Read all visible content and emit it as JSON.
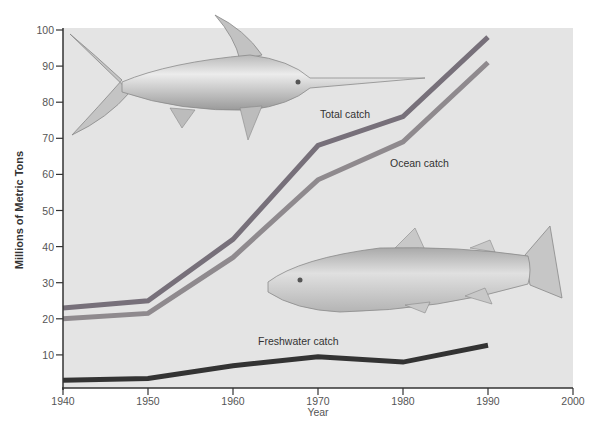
{
  "chart_data": {
    "type": "line",
    "title": "",
    "xlabel": "Year",
    "ylabel": "Millions of Metric Tons",
    "xlim": [
      1940,
      2000
    ],
    "ylim": [
      0,
      100
    ],
    "x_ticks": [
      1940,
      1950,
      1960,
      1970,
      1980,
      1990,
      2000
    ],
    "y_ticks": [
      10,
      20,
      30,
      40,
      50,
      60,
      70,
      80,
      90,
      100
    ],
    "grid": false,
    "x": [
      1940,
      1950,
      1960,
      1970,
      1980,
      1990
    ],
    "series": [
      {
        "name": "Total catch",
        "color": "#77707a",
        "values": [
          23,
          25,
          42,
          68,
          76,
          98
        ]
      },
      {
        "name": "Ocean catch",
        "color": "#8f8a8e",
        "values": [
          20,
          21.5,
          37,
          58.5,
          69,
          91
        ]
      },
      {
        "name": "Freshwater catch",
        "color": "#333333",
        "values": [
          3,
          3.5,
          7,
          9.5,
          8,
          12.7
        ]
      }
    ],
    "annotations": [
      {
        "text": "Total catch",
        "series": "Total catch"
      },
      {
        "text": "Ocean catch",
        "series": "Ocean catch"
      },
      {
        "text": "Freshwater catch",
        "series": "Freshwater catch"
      }
    ],
    "illustrations": [
      "swordfish",
      "trout"
    ]
  }
}
